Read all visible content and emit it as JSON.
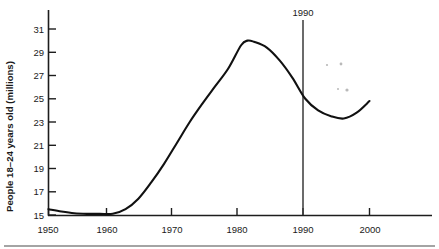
{
  "chart_data": {
    "type": "line",
    "title": "",
    "xlabel": "",
    "ylabel": "People 18–24 years old (millions)",
    "xlim": [
      1950,
      2005
    ],
    "ylim": [
      15,
      31
    ],
    "grid": false,
    "legend": null,
    "x_ticks": [
      1950,
      1960,
      1970,
      1980,
      1990,
      2000
    ],
    "x_tick_labels": [
      "1950",
      "1960",
      "1970",
      "1980",
      "1990",
      "2000"
    ],
    "y_ticks": [
      15,
      17,
      19,
      21,
      23,
      25,
      27,
      29,
      31
    ],
    "y_tick_labels": [
      "15",
      "17",
      "19",
      "21",
      "23",
      "25",
      "27",
      "29",
      "31"
    ],
    "annotations": [
      {
        "text": "1990",
        "x": 1990,
        "type": "vertical-reference-line"
      }
    ],
    "series": [
      {
        "name": "People 18-24 years old (millions)",
        "x": [
          1950,
          1952,
          1954,
          1956,
          1958,
          1960,
          1962,
          1964,
          1966,
          1968,
          1970,
          1972,
          1974,
          1976,
          1978,
          1980,
          1981,
          1982,
          1984,
          1986,
          1988,
          1990,
          1992,
          1994,
          1996,
          1998,
          2000
        ],
        "values": [
          15.5,
          15.3,
          15.15,
          15.1,
          15.1,
          15.1,
          15.5,
          16.4,
          17.8,
          19.4,
          21.2,
          23.0,
          24.6,
          26.1,
          27.6,
          29.6,
          30.0,
          29.9,
          29.4,
          28.3,
          26.8,
          25.0,
          24.0,
          23.5,
          23.3,
          23.8,
          24.8
        ]
      }
    ]
  },
  "chart": {
    "y_axis_title": "People 18–24 years old (millions)",
    "reference_marker_label": "1990",
    "x_axis_labels": [
      "1950",
      "1960",
      "1970",
      "1980",
      "1990",
      "2000"
    ],
    "y_axis_labels": [
      "31",
      "29",
      "27",
      "25",
      "23",
      "21",
      "19",
      "17",
      "15"
    ]
  }
}
